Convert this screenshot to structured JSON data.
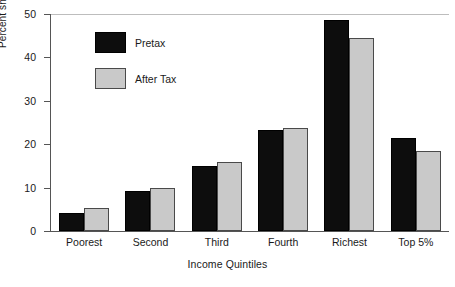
{
  "chart_data": {
    "type": "bar",
    "title": "",
    "xlabel": "Income Quintiles",
    "ylabel": "Percent share of aggregate income",
    "categories": [
      "Poorest",
      "Second",
      "Third",
      "Fourth",
      "Richest",
      "Top 5%"
    ],
    "series": [
      {
        "name": "Pretax",
        "color": "#0d0d0d",
        "values": [
          4.2,
          9.2,
          14.9,
          23.2,
          48.7,
          21.5
        ]
      },
      {
        "name": "After Tax",
        "color": "#c9c9c9",
        "values": [
          5.2,
          10.0,
          15.9,
          23.7,
          44.5,
          18.5
        ]
      }
    ],
    "ylim": [
      0,
      50
    ],
    "yticks": [
      0,
      10,
      20,
      30,
      40,
      50
    ],
    "ytick_labels": [
      "0",
      "10",
      "20",
      "30",
      "40",
      "50"
    ],
    "grid": false,
    "legend_position": "upper-left-inside"
  },
  "legend": {
    "items": [
      {
        "label": "Pretax"
      },
      {
        "label": "After Tax"
      }
    ]
  },
  "axes": {
    "y_title": "Percent share of aggregate income",
    "x_title": "Income Quintiles"
  }
}
